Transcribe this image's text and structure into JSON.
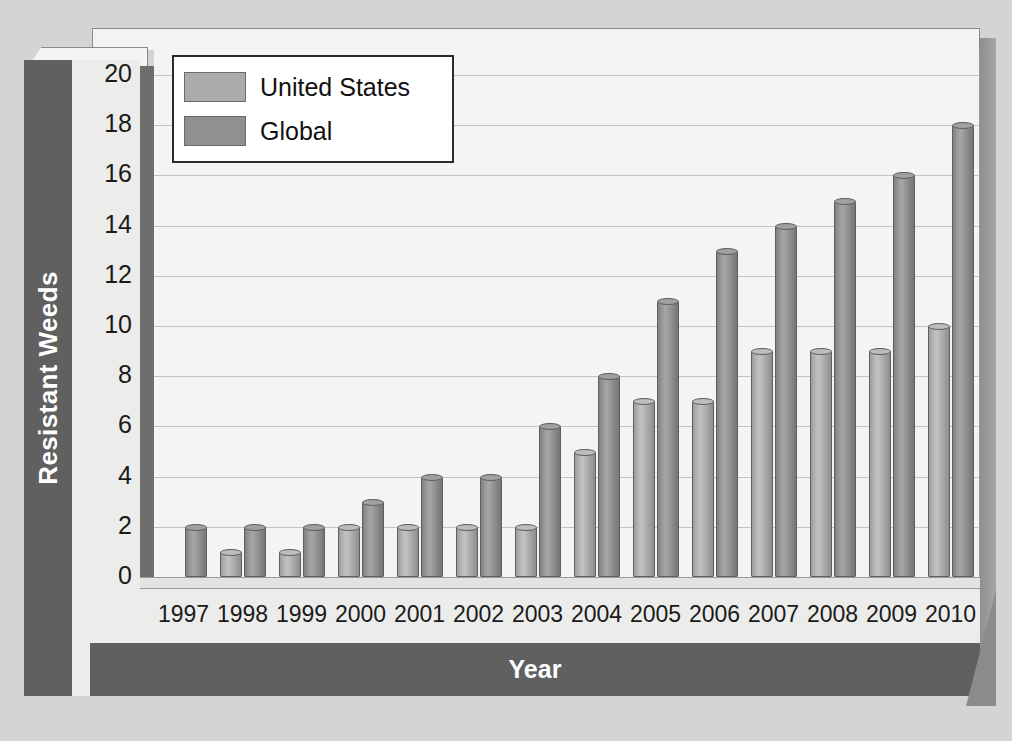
{
  "chart_data": {
    "type": "bar",
    "title": "",
    "xlabel": "Year",
    "ylabel": "Resistant Weeds",
    "categories": [
      "1997",
      "1998",
      "1999",
      "2000",
      "2001",
      "2002",
      "2003",
      "2004",
      "2005",
      "2006",
      "2007",
      "2008",
      "2009",
      "2010"
    ],
    "series": [
      {
        "name": "United States",
        "color": "#ababab",
        "values": [
          0,
          1,
          1,
          2,
          2,
          2,
          2,
          5,
          7,
          7,
          9,
          9,
          9,
          10
        ]
      },
      {
        "name": "Global",
        "color": "#909090",
        "values": [
          2,
          2,
          2,
          3,
          4,
          4,
          6,
          8,
          11,
          13,
          14,
          15,
          16,
          18
        ]
      }
    ],
    "ylim": [
      0,
      21
    ],
    "yticks": [
      0,
      2,
      4,
      6,
      8,
      10,
      12,
      14,
      16,
      18,
      20
    ],
    "ytick_labels": [
      "0",
      "2",
      "4",
      "6",
      "8",
      "10",
      "12",
      "14",
      "16",
      "18",
      "20"
    ],
    "grid": true,
    "legend_position": "top-left",
    "style": "3d-cylinder-bars"
  },
  "legend": {
    "items": [
      {
        "label": "United States"
      },
      {
        "label": "Global"
      }
    ]
  },
  "colors": {
    "page_background": "#d4d4d4",
    "plot_background": "#f4f4f2",
    "panel_dark": "#606060",
    "panel_light": "#ececea",
    "gridline": "#c3c3c0",
    "text_dark": "#1a1a1a",
    "text_light": "#ffffff"
  }
}
